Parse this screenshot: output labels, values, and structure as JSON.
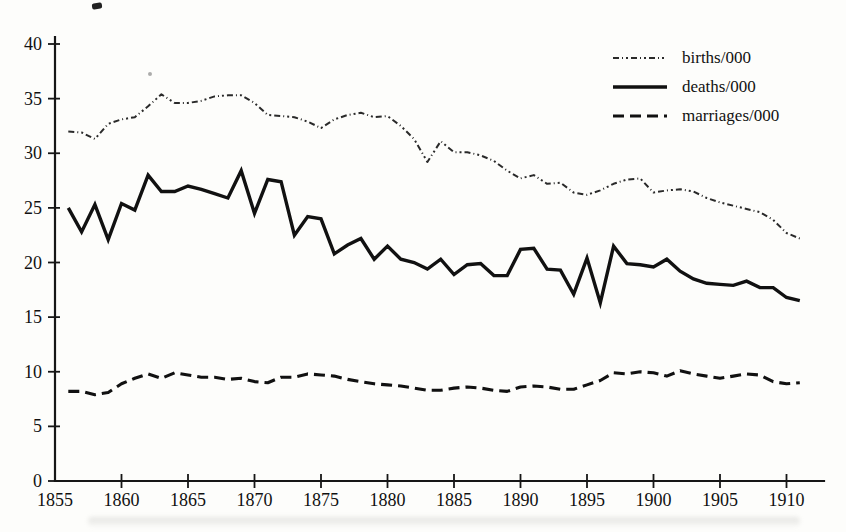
{
  "chart_data": {
    "type": "line",
    "title": "",
    "xlabel": "",
    "ylabel": "",
    "grid": false,
    "xlim": [
      1855,
      1912
    ],
    "ylim": [
      0,
      40
    ],
    "x_ticks": [
      1855,
      1860,
      1865,
      1870,
      1875,
      1880,
      1885,
      1890,
      1895,
      1900,
      1905,
      1910
    ],
    "y_ticks": [
      0,
      5,
      10,
      15,
      20,
      25,
      30,
      35,
      40
    ],
    "line_color": "#161616",
    "legend_position": "top-right",
    "x": [
      1856,
      1857,
      1858,
      1859,
      1860,
      1861,
      1862,
      1863,
      1864,
      1865,
      1866,
      1867,
      1868,
      1869,
      1870,
      1871,
      1872,
      1873,
      1874,
      1875,
      1876,
      1877,
      1878,
      1879,
      1880,
      1881,
      1882,
      1883,
      1884,
      1885,
      1886,
      1887,
      1888,
      1889,
      1890,
      1891,
      1892,
      1893,
      1894,
      1895,
      1896,
      1897,
      1898,
      1899,
      1900,
      1901,
      1902,
      1903,
      1904,
      1905,
      1906,
      1907,
      1908,
      1909,
      1910,
      1911
    ],
    "series": [
      {
        "name": "births/000",
        "style": "dotted",
        "values": [
          32.0,
          31.9,
          31.3,
          32.7,
          33.1,
          33.3,
          34.3,
          35.4,
          34.6,
          34.6,
          34.8,
          35.2,
          35.3,
          35.3,
          34.6,
          33.5,
          33.4,
          33.3,
          32.9,
          32.3,
          33.1,
          33.5,
          33.7,
          33.3,
          33.4,
          32.5,
          31.3,
          29.2,
          31.1,
          30.1,
          30.1,
          29.8,
          29.3,
          28.4,
          27.7,
          28.0,
          27.2,
          27.3,
          26.4,
          26.2,
          26.6,
          27.2,
          27.6,
          27.7,
          26.4,
          26.6,
          26.7,
          26.5,
          25.9,
          25.5,
          25.2,
          24.9,
          24.6,
          23.9,
          22.7,
          22.2
        ]
      },
      {
        "name": "deaths/000",
        "style": "solid",
        "values": [
          25.0,
          22.8,
          25.3,
          22.1,
          25.4,
          24.8,
          28.0,
          26.5,
          26.5,
          27.0,
          26.7,
          26.3,
          25.9,
          28.4,
          24.5,
          27.6,
          27.4,
          22.5,
          24.2,
          24.0,
          20.8,
          21.6,
          22.2,
          20.3,
          21.5,
          20.3,
          20.0,
          19.4,
          20.3,
          18.9,
          19.8,
          19.9,
          18.8,
          18.8,
          21.2,
          21.3,
          19.4,
          19.3,
          17.1,
          20.4,
          16.3,
          21.5,
          19.9,
          19.8,
          19.6,
          20.3,
          19.2,
          18.5,
          18.1,
          18.0,
          17.9,
          18.3,
          17.7,
          17.7,
          16.8,
          16.5
        ]
      },
      {
        "name": "marriages/000",
        "style": "dashed",
        "values": [
          8.2,
          8.2,
          7.9,
          8.1,
          8.9,
          9.4,
          9.8,
          9.4,
          9.9,
          9.7,
          9.5,
          9.5,
          9.3,
          9.4,
          9.1,
          9.0,
          9.5,
          9.5,
          9.8,
          9.7,
          9.6,
          9.3,
          9.1,
          8.9,
          8.8,
          8.7,
          8.5,
          8.3,
          8.3,
          8.5,
          8.6,
          8.5,
          8.3,
          8.2,
          8.6,
          8.7,
          8.6,
          8.4,
          8.4,
          8.8,
          9.2,
          9.9,
          9.8,
          10.0,
          9.9,
          9.6,
          10.1,
          9.8,
          9.6,
          9.4,
          9.6,
          9.8,
          9.7,
          9.1,
          8.9,
          9.0
        ]
      }
    ]
  }
}
